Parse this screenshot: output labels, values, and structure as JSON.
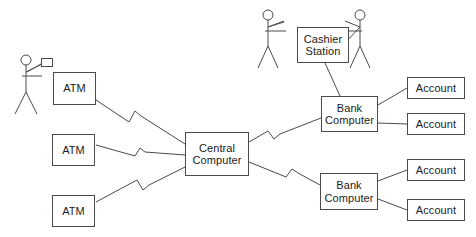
{
  "diagram": {
    "type": "network-block-diagram",
    "background_color": "#ffffff",
    "line_color": "#4a4a4a",
    "text_color": "#1b1b1b",
    "nodes": [
      {
        "id": "atm-1",
        "label": "ATM",
        "x": 53,
        "y": 72,
        "w": 43,
        "h": 33
      },
      {
        "id": "atm-2",
        "label": "ATM",
        "x": 52,
        "y": 134,
        "w": 43,
        "h": 32
      },
      {
        "id": "atm-3",
        "label": "ATM",
        "x": 52,
        "y": 195,
        "w": 43,
        "h": 32
      },
      {
        "id": "central-computer",
        "label": "Central\nComputer",
        "x": 185,
        "y": 132,
        "w": 64,
        "h": 44
      },
      {
        "id": "cashier-station",
        "label": "Cashier\nStation",
        "x": 297,
        "y": 27,
        "w": 52,
        "h": 36
      },
      {
        "id": "bank-computer-1",
        "label": "Bank\nComputer",
        "x": 321,
        "y": 96,
        "w": 57,
        "h": 36
      },
      {
        "id": "bank-computer-2",
        "label": "Bank\nComputer",
        "x": 320,
        "y": 173,
        "w": 58,
        "h": 37
      },
      {
        "id": "account-1",
        "label": "Account",
        "x": 407,
        "y": 77,
        "w": 58,
        "h": 22
      },
      {
        "id": "account-2",
        "label": "Account",
        "x": 407,
        "y": 113,
        "w": 58,
        "h": 22
      },
      {
        "id": "account-3",
        "label": "Account",
        "x": 407,
        "y": 159,
        "w": 58,
        "h": 22
      },
      {
        "id": "account-4",
        "label": "Account",
        "x": 407,
        "y": 199,
        "w": 58,
        "h": 22
      }
    ],
    "card_rect": {
      "id": "atm-card",
      "x": 41,
      "y": 58,
      "w": 12,
      "h": 9
    },
    "actors": [
      {
        "id": "atm-customer",
        "head_cx": 26,
        "head_cy": 60,
        "head_r": 5
      },
      {
        "id": "cashier-clerk",
        "head_cx": 268,
        "head_cy": 15,
        "head_r": 5
      },
      {
        "id": "bank-customer",
        "head_cx": 360,
        "head_cy": 15,
        "head_r": 5
      }
    ],
    "links": [
      {
        "from": "atm-1",
        "to": "central-computer",
        "style": "lightning"
      },
      {
        "from": "atm-2",
        "to": "central-computer",
        "style": "lightning"
      },
      {
        "from": "atm-3",
        "to": "central-computer",
        "style": "lightning"
      },
      {
        "from": "central-computer",
        "to": "bank-computer-1",
        "style": "lightning"
      },
      {
        "from": "central-computer",
        "to": "bank-computer-2",
        "style": "lightning"
      },
      {
        "from": "cashier-station",
        "to": "bank-computer-1",
        "style": "plain"
      },
      {
        "from": "bank-computer-1",
        "to": "account-1",
        "style": "plain"
      },
      {
        "from": "bank-computer-1",
        "to": "account-2",
        "style": "plain"
      },
      {
        "from": "bank-computer-2",
        "to": "account-3",
        "style": "plain"
      },
      {
        "from": "bank-computer-2",
        "to": "account-4",
        "style": "plain"
      },
      {
        "from": "atm-customer",
        "to": "atm-card",
        "style": "plain"
      },
      {
        "from": "cashier-clerk",
        "to": "cashier-station",
        "style": "plain"
      },
      {
        "from": "bank-customer",
        "to": "cashier-station",
        "style": "plain"
      }
    ]
  }
}
